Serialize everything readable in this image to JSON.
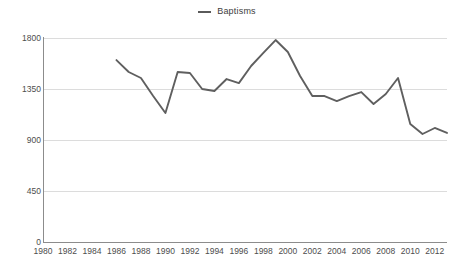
{
  "legend": {
    "position": "top-center",
    "entries": [
      {
        "label": "Baptisms",
        "color": "#5f5f5f",
        "marker": "line-swatch"
      }
    ]
  },
  "axes": {
    "y": {
      "ticks": [
        "0",
        "450",
        "900",
        "1350",
        "1800"
      ],
      "min": 0,
      "max": 1800,
      "step": 450,
      "gridlines": true
    },
    "x": {
      "ticks": [
        "1980",
        "1982",
        "1984",
        "1986",
        "1988",
        "1990",
        "1992",
        "1994",
        "1996",
        "1998",
        "2000",
        "2002",
        "2004",
        "2006",
        "2008",
        "2010",
        "2012"
      ],
      "min": 1980,
      "max": 2013,
      "step": 2,
      "gridlines": false
    }
  },
  "colors": {
    "series": "#5f5f5f",
    "gridline": "#dcdcdc",
    "axis": "#8c8c8c",
    "text": "#4d4d4d",
    "background": "#ffffff"
  },
  "chart_data": {
    "type": "line",
    "title": "",
    "subtitle": "",
    "xlabel": "",
    "ylabel": "",
    "xlim": [
      1980,
      2013
    ],
    "ylim": [
      0,
      1800
    ],
    "grid": true,
    "legend_position": "top-center",
    "x": [
      1986,
      1987,
      1988,
      1989,
      1990,
      1991,
      1992,
      1993,
      1994,
      1995,
      1996,
      1997,
      1998,
      1999,
      2000,
      2001,
      2002,
      2003,
      2004,
      2005,
      2006,
      2007,
      2008,
      2009,
      2010,
      2011,
      2012,
      2013
    ],
    "series": [
      {
        "name": "Baptisms",
        "color": "#5f5f5f",
        "values": [
          1605,
          1500,
          1447,
          1288,
          1138,
          1500,
          1491,
          1350,
          1332,
          1438,
          1402,
          1553,
          1668,
          1782,
          1676,
          1465,
          1288,
          1288,
          1244,
          1288,
          1323,
          1218,
          1306,
          1447,
          1041,
          953,
          1006,
          962
        ]
      }
    ],
    "ytick_values": [
      0,
      450,
      900,
      1350,
      1800
    ],
    "xtick_values": [
      1980,
      1982,
      1984,
      1986,
      1988,
      1990,
      1992,
      1994,
      1996,
      1998,
      2000,
      2002,
      2004,
      2006,
      2008,
      2010,
      2012
    ]
  }
}
